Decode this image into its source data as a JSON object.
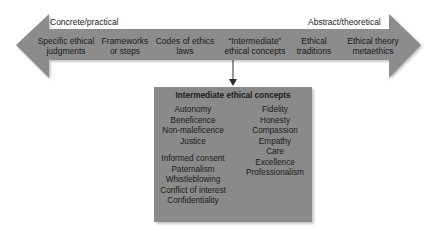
{
  "arrow": {
    "left_end_label": "Concrete/practical",
    "right_end_label": "Abstract/theoretical",
    "color": "#8c8c8c",
    "stages": [
      {
        "line1": "Specific ethical",
        "line2": "judgments"
      },
      {
        "line1": "Frameworks",
        "line2": "or steps"
      },
      {
        "line1": "Codes of ethics",
        "line2": "laws"
      },
      {
        "line1": "“Intermediate”",
        "line2": "ethical concepts"
      },
      {
        "line1": "Ethical",
        "line2": "traditions"
      },
      {
        "line1": "Ethical theory",
        "line2": "metaethics"
      }
    ]
  },
  "concepts_box": {
    "title": "Intermediate ethical concepts",
    "color": "#8a8a8a",
    "left_group1": [
      "Autonomy",
      "Beneficence",
      "Non-maleficence",
      "Justice"
    ],
    "left_group2": [
      "Informed consent",
      "Paternalism",
      "Whistleblowing",
      "Conflict of interest",
      "Confidentiality"
    ],
    "right_column": [
      "Fidelity",
      "Honesty",
      "Compassion",
      "Empathy",
      "Care",
      "Excellence",
      "Professionalism"
    ]
  }
}
